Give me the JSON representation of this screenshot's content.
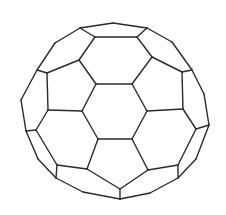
{
  "figure": {
    "stroke_color": "#2a2a2a",
    "background": "#ffffff",
    "stroke_width": 1.4,
    "vertices": {
      "o1": [
        80,
        28
      ],
      "o2": [
        113,
        23
      ],
      "o3": [
        147,
        28
      ],
      "o4": [
        172,
        42
      ],
      "o5": [
        192,
        70
      ],
      "o6": [
        204,
        94
      ],
      "o7": [
        209,
        125
      ],
      "o8": [
        196,
        159
      ],
      "o9": [
        178,
        178
      ],
      "o10": [
        150,
        193
      ],
      "o11": [
        120,
        199
      ],
      "o12": [
        83,
        192
      ],
      "o13": [
        56,
        178
      ],
      "o14": [
        38,
        159
      ],
      "o15": [
        26,
        131
      ],
      "o16": [
        21,
        100
      ],
      "o17": [
        37,
        70
      ],
      "o18": [
        55,
        43
      ],
      "t1": [
        95,
        37
      ],
      "t2": [
        137,
        37
      ],
      "t3": [
        152,
        57
      ],
      "t4": [
        132,
        84
      ],
      "t5": [
        96,
        84
      ],
      "t6": [
        79,
        60
      ],
      "l1": [
        47,
        73
      ],
      "l2": [
        48,
        110
      ],
      "r1": [
        182,
        72
      ],
      "r2": [
        183,
        109
      ],
      "c1": [
        147,
        111
      ],
      "c2": [
        132,
        139
      ],
      "c3": [
        98,
        139
      ],
      "c4": [
        82,
        111
      ],
      "ll1": [
        36,
        130
      ],
      "ll2": [
        57,
        165
      ],
      "ll3": [
        87,
        169
      ],
      "lr1": [
        196,
        129
      ],
      "lr2": [
        178,
        165
      ],
      "lr3": [
        148,
        170
      ],
      "b1": [
        120,
        189
      ],
      "e1": [
        57,
        177
      ],
      "e2": [
        178,
        177
      ],
      "e3": [
        120,
        199
      ]
    },
    "edges": [
      [
        "o1",
        "o2"
      ],
      [
        "o2",
        "o3"
      ],
      [
        "o3",
        "o4"
      ],
      [
        "o4",
        "o5"
      ],
      [
        "o5",
        "o6"
      ],
      [
        "o6",
        "o7"
      ],
      [
        "o7",
        "o8"
      ],
      [
        "o8",
        "o9"
      ],
      [
        "o9",
        "o10"
      ],
      [
        "o10",
        "o11"
      ],
      [
        "o11",
        "o12"
      ],
      [
        "o12",
        "o13"
      ],
      [
        "o13",
        "o14"
      ],
      [
        "o14",
        "o15"
      ],
      [
        "o15",
        "o16"
      ],
      [
        "o16",
        "o17"
      ],
      [
        "o17",
        "o18"
      ],
      [
        "o18",
        "o1"
      ],
      [
        "o1",
        "t1"
      ],
      [
        "t1",
        "t2"
      ],
      [
        "t2",
        "o3"
      ],
      [
        "t2",
        "t3"
      ],
      [
        "t3",
        "t4"
      ],
      [
        "t4",
        "t5"
      ],
      [
        "t5",
        "t6"
      ],
      [
        "t6",
        "t1"
      ],
      [
        "t6",
        "l1"
      ],
      [
        "l1",
        "o17"
      ],
      [
        "l1",
        "l2"
      ],
      [
        "l2",
        "c4"
      ],
      [
        "c4",
        "t5"
      ],
      [
        "t3",
        "r1"
      ],
      [
        "r1",
        "o5"
      ],
      [
        "r1",
        "r2"
      ],
      [
        "r2",
        "c1"
      ],
      [
        "c1",
        "t4"
      ],
      [
        "c1",
        "c2"
      ],
      [
        "c2",
        "c3"
      ],
      [
        "c3",
        "c4"
      ],
      [
        "l2",
        "ll1"
      ],
      [
        "ll1",
        "o15"
      ],
      [
        "ll1",
        "ll2"
      ],
      [
        "ll2",
        "ll3"
      ],
      [
        "ll3",
        "c3"
      ],
      [
        "r2",
        "lr1"
      ],
      [
        "lr1",
        "o7"
      ],
      [
        "lr1",
        "lr2"
      ],
      [
        "lr2",
        "lr3"
      ],
      [
        "lr3",
        "c2"
      ],
      [
        "ll3",
        "b1"
      ],
      [
        "b1",
        "lr3"
      ],
      [
        "b1",
        "o11"
      ],
      [
        "ll2",
        "o13"
      ],
      [
        "lr2",
        "o9"
      ]
    ]
  }
}
